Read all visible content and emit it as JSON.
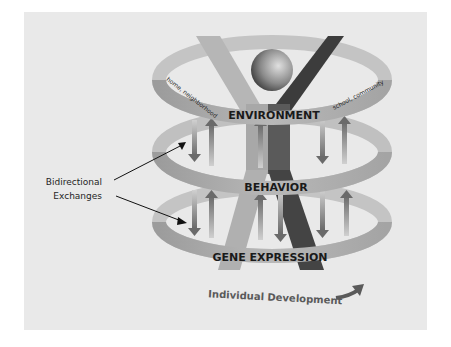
{
  "diagram": {
    "levels": [
      {
        "label": "ENVIRONMENT",
        "sublabel_left": "home, neighborhood",
        "sublabel_right": "school, community"
      },
      {
        "label": "BEHAVIOR"
      },
      {
        "label": "GENE EXPRESSION"
      }
    ],
    "annotation": {
      "line1": "Bidirectional",
      "line2": "Exchanges"
    },
    "footer": {
      "label": "Individual Development"
    },
    "colors": {
      "background": "#e9e9e9",
      "ring": "#a9a9a9",
      "ring_dark": "#8a8a8a",
      "figure_light": "#b4b4b4",
      "figure_dark": "#3a3a3a",
      "arrow": "#7a7a7a",
      "text": "#1a1a1a"
    },
    "icons": [
      "person-figure-icon",
      "bidirectional-arrow-icon",
      "curved-arrow-icon"
    ]
  }
}
